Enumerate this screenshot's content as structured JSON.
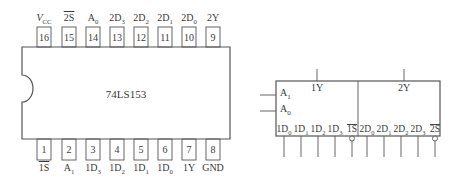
{
  "dip": {
    "chip_name": "74LS153",
    "top_pins": [
      {
        "num": "16",
        "label": "V",
        "sub": "CC",
        "italic": true
      },
      {
        "num": "15",
        "label": "2S",
        "over": true
      },
      {
        "num": "14",
        "label": "A",
        "sub": "0"
      },
      {
        "num": "13",
        "label": "2D",
        "sub": "3"
      },
      {
        "num": "12",
        "label": "2D",
        "sub": "2"
      },
      {
        "num": "11",
        "label": "2D",
        "sub": "1"
      },
      {
        "num": "10",
        "label": "2D",
        "sub": "0"
      },
      {
        "num": "9",
        "label": "2Y"
      }
    ],
    "bottom_pins": [
      {
        "num": "1",
        "label": "1S",
        "over": true
      },
      {
        "num": "2",
        "label": "A",
        "sub": "1"
      },
      {
        "num": "3",
        "label": "1D",
        "sub": "3"
      },
      {
        "num": "4",
        "label": "1D",
        "sub": "2"
      },
      {
        "num": "5",
        "label": "1D",
        "sub": "1"
      },
      {
        "num": "6",
        "label": "1D",
        "sub": "0"
      },
      {
        "num": "7",
        "label": "1Y"
      },
      {
        "num": "8",
        "label": "GND"
      }
    ]
  },
  "logic_symbol": {
    "outputs": [
      "1Y",
      "2Y"
    ],
    "select_inputs": [
      {
        "label": "A",
        "sub": "1"
      },
      {
        "label": "A",
        "sub": "0"
      }
    ],
    "bottom_inputs": [
      {
        "label": "1D",
        "sub": "0",
        "bubble": false
      },
      {
        "label": "1D",
        "sub": "1",
        "bubble": false
      },
      {
        "label": "1D",
        "sub": "2",
        "bubble": false
      },
      {
        "label": "1D",
        "sub": "3",
        "bubble": false
      },
      {
        "label": "1S",
        "over": true,
        "bubble": true
      },
      {
        "label": "2D",
        "sub": "0",
        "bubble": false
      },
      {
        "label": "2D",
        "sub": "1",
        "bubble": false
      },
      {
        "label": "2D",
        "sub": "2",
        "bubble": false
      },
      {
        "label": "2D",
        "sub": "3",
        "bubble": false
      },
      {
        "label": "2S",
        "over": true,
        "bubble": true
      }
    ]
  }
}
